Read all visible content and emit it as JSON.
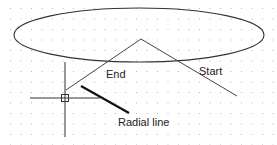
{
  "diagram": {
    "background": "#ffffff",
    "grid": {
      "spacing": 10.5,
      "dot_color": "#b8b8b8",
      "dot_size": 1
    },
    "ellipse": {
      "cx": 139,
      "cy": 35,
      "rx": 125,
      "ry": 27,
      "stroke": "#333333"
    },
    "arc_polyline": {
      "points": [
        [
          66,
          90
        ],
        [
          141,
          39
        ],
        [
          237,
          96
        ]
      ],
      "stroke": "#444444"
    },
    "crosshair": {
      "center": [
        65,
        98
      ],
      "horizontal": [
        30,
        102
      ],
      "vertical": [
        62,
        137
      ],
      "pickbox_size": 7,
      "stroke": "#333333"
    },
    "radial_line": {
      "from": [
        83,
        117
      ],
      "to": [
        129,
        117
      ],
      "points": [
        [
          82,
          86
        ],
        [
          129,
          113
        ]
      ],
      "stroke": "#111111"
    },
    "labels": {
      "end": "End",
      "start": "Start",
      "radial": "Radial line"
    }
  }
}
